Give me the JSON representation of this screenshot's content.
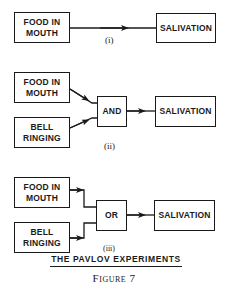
{
  "diagram": {
    "title": "THE PAVLOV EXPERIMENTS",
    "caption": "Figure 7",
    "panels": [
      {
        "label": "(i)",
        "inputs": [
          "FOOD IN\nMOUTH"
        ],
        "gate": null,
        "output": "SALIVATION"
      },
      {
        "label": "(ii)",
        "inputs": [
          "FOOD IN\nMOUTH",
          "BELL\nRINGING"
        ],
        "gate": "AND",
        "output": "SALIVATION"
      },
      {
        "label": "(iii)",
        "inputs": [
          "FOOD IN\nMOUTH",
          "BELL\nRINGING"
        ],
        "gate": "OR",
        "output": "SALIVATION"
      }
    ]
  }
}
